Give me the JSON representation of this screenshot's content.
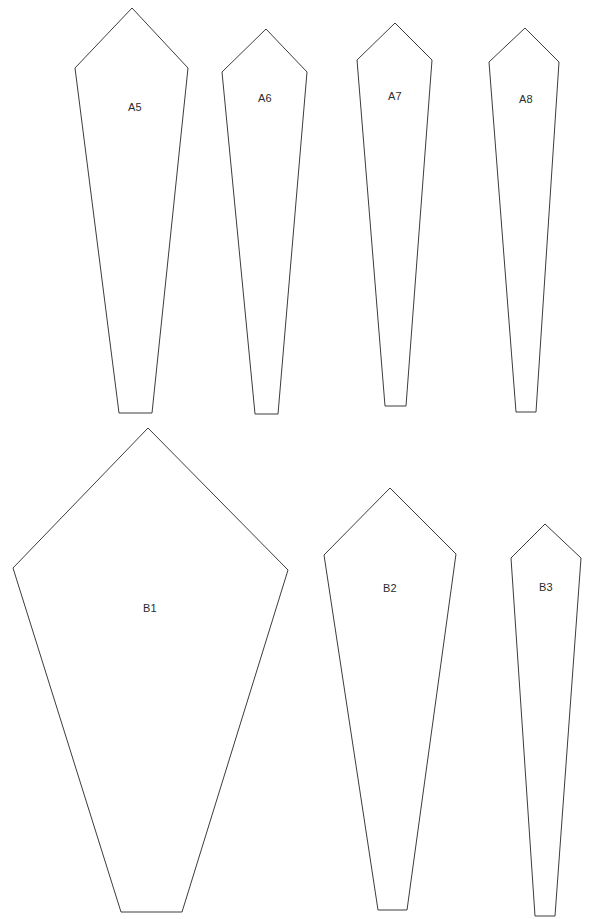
{
  "sheet": {
    "title": "Pattern Template Sheet",
    "background_color": "#ffffff",
    "stroke_color": "#3c3c3c",
    "label_color": "#2b2b2b",
    "width": 601,
    "height": 919
  },
  "pieces": [
    {
      "id": "A5",
      "label": "A5",
      "group": "A",
      "points": "132,8 188,68 152,413 119,413 75,68",
      "label_x": 135,
      "label_y": 111
    },
    {
      "id": "A6",
      "label": "A6",
      "group": "A",
      "points": "266,29 307,72 278,414 255,414 222,72",
      "label_x": 265,
      "label_y": 102
    },
    {
      "id": "A7",
      "label": "A7",
      "group": "A",
      "points": "395,23 432,60 406,406 385,406 357,60",
      "label_x": 395,
      "label_y": 100
    },
    {
      "id": "A8",
      "label": "A8",
      "group": "A",
      "points": "525,28 559,62 536,412 516,412 489,62",
      "label_x": 526,
      "label_y": 103
    },
    {
      "id": "B1",
      "label": "B1",
      "group": "B",
      "points": "148,428 288,570 182,912 121,912 13,568",
      "label_x": 150,
      "label_y": 612
    },
    {
      "id": "B2",
      "label": "B2",
      "group": "B",
      "points": "390,488 456,554 407,910 378,910 324,555",
      "label_x": 390,
      "label_y": 592
    },
    {
      "id": "B3",
      "label": "B3",
      "group": "B",
      "points": "545,524 581,558 555,916 535,916 511,558",
      "label_x": 546,
      "label_y": 591
    }
  ]
}
